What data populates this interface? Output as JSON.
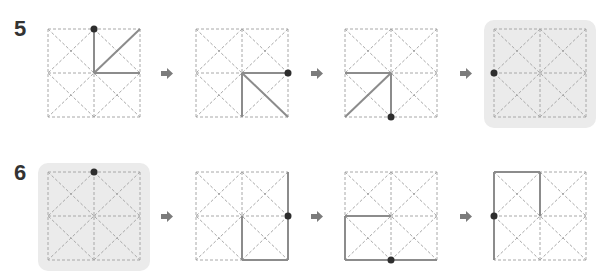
{
  "colors": {
    "guide": "#a8a8a8",
    "stroke": "#8c8c8c",
    "dot": "#2e2e2e",
    "highlight": "#ebebeb",
    "arrow": "#7c7c7c",
    "label": "#333333"
  },
  "icons": {
    "arrow": "right-arrow-icon",
    "dot": "start-dot"
  },
  "rows": [
    {
      "label": "5",
      "steps": [
        {
          "highlighted": false,
          "dot": "top-center",
          "strokes": [
            "center-to-top-center",
            "center-to-top-right",
            "center-to-right-center"
          ]
        },
        {
          "highlighted": false,
          "dot": "right-center",
          "strokes": [
            "center-to-right-center",
            "center-to-bottom-center",
            "center-to-bottom-right"
          ]
        },
        {
          "highlighted": false,
          "dot": "bottom-center",
          "strokes": [
            "left-center-to-center",
            "center-to-bottom-center",
            "center-to-bottom-left"
          ]
        },
        {
          "highlighted": true,
          "dot": "left-center",
          "strokes": []
        }
      ]
    },
    {
      "label": "6",
      "steps": [
        {
          "highlighted": true,
          "dot": "top-center",
          "strokes": []
        },
        {
          "highlighted": false,
          "dot": "right-center",
          "strokes": [
            "right-edge-full",
            "center-to-bottom-center",
            "bottom-center-to-bottom-right"
          ]
        },
        {
          "highlighted": false,
          "dot": "bottom-center",
          "strokes": [
            "left-center-to-center",
            "left-center-to-bottom-left",
            "bottom-edge-full"
          ]
        },
        {
          "highlighted": false,
          "dot": "left-center",
          "strokes": [
            "left-edge-full",
            "top-left-to-top-center",
            "top-center-to-center"
          ]
        }
      ]
    }
  ]
}
